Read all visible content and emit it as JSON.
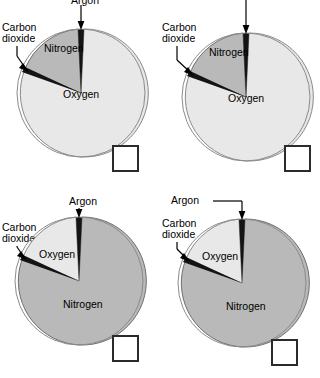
{
  "page": {
    "kind": "multiple-choice-pie-chart-question"
  },
  "colors": {
    "light_slice": "#e8e8e8",
    "dark_slice": "#b9b9b9",
    "argon_slice": "#141414",
    "outline": "#8a8a8a",
    "text": "#000000",
    "checkbox_border": "#2b2b2b",
    "checkbox_fill": "#ffffff"
  },
  "labels": {
    "argon": "Argon",
    "carbon_dioxide_line1": "Carbon",
    "carbon_dioxide_line2": "dioxide",
    "nitrogen": "Nitrogen",
    "oxygen": "Oxygen"
  },
  "charts": [
    {
      "id": "chart-top-left",
      "position": "top-left",
      "argon_label_clipped": true,
      "argon_leader": "straight-down",
      "slices": [
        {
          "name": "Argon",
          "label": "Argon",
          "value": 1,
          "shade": "dark-black",
          "start_deg": 0,
          "end_deg": 4
        },
        {
          "name": "Oxygen",
          "label": "Oxygen",
          "value": 69,
          "shade": "light",
          "start_deg": 4,
          "end_deg": 252
        },
        {
          "name": "Carbon dioxide",
          "label": "Carbon dioxide",
          "value": 1,
          "shade": "dark-black",
          "start_deg": 252,
          "end_deg": 255
        },
        {
          "name": "Nitrogen",
          "label": "Nitrogen",
          "value": 29,
          "shade": "dark",
          "start_deg": 255,
          "end_deg": 360
        }
      ],
      "inner_labels": [
        "Nitrogen",
        "Oxygen"
      ],
      "callouts": [
        "Argon",
        "Carbon dioxide"
      ]
    },
    {
      "id": "chart-top-right",
      "position": "top-right",
      "argon_label_clipped": true,
      "argon_leader": "straight-down-long",
      "slices": [
        {
          "name": "Argon",
          "label": "Argon",
          "value": 1,
          "shade": "dark-black",
          "start_deg": 0,
          "end_deg": 3
        },
        {
          "name": "Oxygen",
          "label": "Oxygen",
          "value": 69,
          "shade": "light",
          "start_deg": 3,
          "end_deg": 252
        },
        {
          "name": "Carbon dioxide",
          "label": "Carbon dioxide",
          "value": 1,
          "shade": "dark-black",
          "start_deg": 252,
          "end_deg": 256
        },
        {
          "name": "Nitrogen",
          "label": "Nitrogen",
          "value": 29,
          "shade": "dark",
          "start_deg": 256,
          "end_deg": 360
        }
      ],
      "inner_labels": [
        "Nitrogen",
        "Oxygen"
      ],
      "callouts": [
        "Argon",
        "Carbon dioxide"
      ]
    },
    {
      "id": "chart-bottom-left",
      "position": "bottom-left",
      "argon_label_clipped": false,
      "argon_leader": "straight-down",
      "slices": [
        {
          "name": "Argon",
          "label": "Argon",
          "value": 1,
          "shade": "dark-black",
          "start_deg": 0,
          "end_deg": 4
        },
        {
          "name": "Nitrogen",
          "label": "Nitrogen",
          "value": 69,
          "shade": "dark",
          "start_deg": 4,
          "end_deg": 252
        },
        {
          "name": "Carbon dioxide",
          "label": "Carbon dioxide",
          "value": 1,
          "shade": "dark-black",
          "start_deg": 252,
          "end_deg": 255
        },
        {
          "name": "Oxygen",
          "label": "Oxygen",
          "value": 29,
          "shade": "light",
          "start_deg": 255,
          "end_deg": 360
        }
      ],
      "inner_labels": [
        "Oxygen",
        "Nitrogen"
      ],
      "callouts": [
        "Argon",
        "Carbon dioxide"
      ]
    },
    {
      "id": "chart-bottom-right",
      "position": "bottom-right",
      "argon_label_clipped": false,
      "argon_leader": "elbow-right",
      "slices": [
        {
          "name": "Argon",
          "label": "Argon",
          "value": 1,
          "shade": "dark-black",
          "start_deg": 0,
          "end_deg": 3
        },
        {
          "name": "Nitrogen",
          "label": "Nitrogen",
          "value": 69,
          "shade": "dark",
          "start_deg": 3,
          "end_deg": 252
        },
        {
          "name": "Carbon dioxide",
          "label": "Carbon dioxide",
          "value": 1,
          "shade": "dark-black",
          "start_deg": 252,
          "end_deg": 256
        },
        {
          "name": "Oxygen",
          "label": "Oxygen",
          "value": 29,
          "shade": "light",
          "start_deg": 256,
          "end_deg": 360
        }
      ],
      "inner_labels": [
        "Oxygen",
        "Nitrogen"
      ],
      "callouts": [
        "Argon",
        "Carbon dioxide"
      ]
    }
  ],
  "checkboxes": [
    {
      "id": "checkbox-top-left",
      "for_chart": "chart-top-left",
      "checked": false,
      "clipped": false
    },
    {
      "id": "checkbox-top-right",
      "for_chart": "chart-top-right",
      "checked": false,
      "clipped": false
    },
    {
      "id": "checkbox-bottom-left",
      "for_chart": "chart-bottom-left",
      "checked": false,
      "clipped": false
    },
    {
      "id": "checkbox-bottom-right",
      "for_chart": "chart-bottom-right",
      "checked": false,
      "clipped": true
    }
  ]
}
